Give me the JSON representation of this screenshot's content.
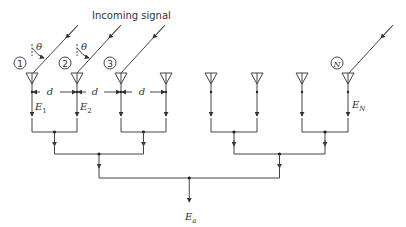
{
  "diagram": {
    "title_label": "Incoming signal",
    "angle_label": "θ",
    "spacing_label": "d",
    "element_count_shown": 8,
    "element_numbers": [
      "1",
      "2",
      "3",
      "N"
    ],
    "field_labels": {
      "e1": {
        "base": "E",
        "sub": "1"
      },
      "e2": {
        "base": "E",
        "sub": "2"
      },
      "en": {
        "base": "E",
        "sub": "N"
      },
      "ea": {
        "base": "E",
        "sub": "a"
      }
    },
    "combiner_levels": 3
  }
}
